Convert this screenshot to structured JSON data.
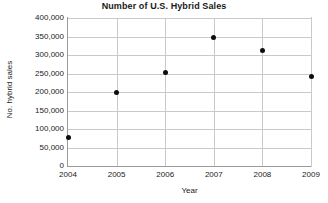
{
  "chart_data": {
    "type": "scatter",
    "title": "Number of U.S. Hybrid Sales",
    "xlabel": "Year",
    "ylabel": "No. hybrid sales",
    "x": [
      2004,
      2005,
      2006,
      2007,
      2008,
      2009
    ],
    "values": [
      76000,
      200000,
      253000,
      347000,
      313000,
      242000
    ],
    "categories": [
      "2004",
      "2005",
      "2006",
      "2007",
      "2008",
      "2009"
    ],
    "xlim": [
      2004,
      2009
    ],
    "ylim": [
      0,
      400000
    ],
    "xticks": [
      "2004",
      "2005",
      "2006",
      "2007",
      "2008",
      "2009"
    ],
    "yticks": [
      "0",
      "50,000",
      "100,000",
      "150,000",
      "200,000",
      "250,000",
      "300,000",
      "350,000",
      "400,000"
    ],
    "ytick_values": [
      0,
      50000,
      100000,
      150000,
      200000,
      250000,
      300000,
      350000,
      400000
    ],
    "grid": true,
    "legend": null,
    "marker_color": "#0d0d0d",
    "gridline_color": "#c9c9c9",
    "axis_color": "#9a9a9a",
    "background_color": "#ffffff",
    "points": [
      {
        "label": "2004",
        "x": 2004,
        "y": 76000
      },
      {
        "label": "2005",
        "x": 2005,
        "y": 200000
      },
      {
        "label": "2006",
        "x": 2006,
        "y": 253000
      },
      {
        "label": "2007",
        "x": 2007,
        "y": 347000
      },
      {
        "label": "2008",
        "x": 2008,
        "y": 313000
      },
      {
        "label": "2009",
        "x": 2009,
        "y": 242000
      }
    ]
  }
}
